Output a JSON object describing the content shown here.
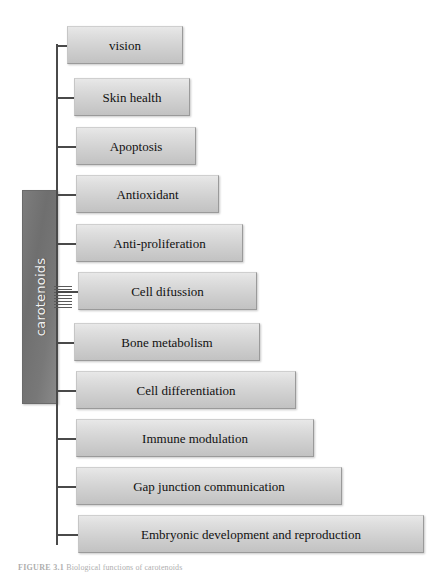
{
  "figure": {
    "caption_label": "FIGURE 3.1",
    "caption_text": "Biological functions of carotenoids",
    "background_color": "#ffffff",
    "line_color": "#4a4a4a"
  },
  "root": {
    "label": "carotenoids",
    "fill_color": "#7a7a7a",
    "text_color": "#f2f2f2"
  },
  "nodes": [
    {
      "label": "vision",
      "x": 67,
      "y": 26,
      "width": 116,
      "height": 38
    },
    {
      "label": "Skin health",
      "x": 74,
      "y": 78,
      "width": 116,
      "height": 38
    },
    {
      "label": "Apoptosis",
      "x": 76,
      "y": 127,
      "width": 120,
      "height": 38
    },
    {
      "label": "Antioxidant",
      "x": 76,
      "y": 175,
      "width": 143,
      "height": 38
    },
    {
      "label": "Anti-proliferation",
      "x": 76,
      "y": 224,
      "width": 167,
      "height": 38
    },
    {
      "label": "Cell difussion",
      "x": 78,
      "y": 272,
      "width": 179,
      "height": 38
    },
    {
      "label": "Bone metabolism",
      "x": 74,
      "y": 323,
      "width": 186,
      "height": 38
    },
    {
      "label": "Cell differentiation",
      "x": 76,
      "y": 371,
      "width": 220,
      "height": 38
    },
    {
      "label": "Immune modulation",
      "x": 76,
      "y": 419,
      "width": 238,
      "height": 38
    },
    {
      "label": "Gap junction communication",
      "x": 76,
      "y": 467,
      "width": 266,
      "height": 38
    },
    {
      "label": "Embryonic development and reproduction",
      "x": 78,
      "y": 515,
      "width": 346,
      "height": 38
    }
  ],
  "node_style": {
    "fill_top": "#e8e8e8",
    "fill_bottom": "#c2c2c2",
    "border_color": "#9a9a9a",
    "text_color": "#111111"
  }
}
